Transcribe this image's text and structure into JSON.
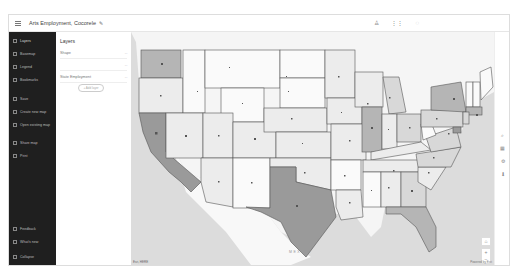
{
  "header": {
    "title": "Arts Employment, Cocorele",
    "icons": [
      "menu-icon",
      "pencil-icon",
      "notification-icon",
      "apps-icon",
      "user-icon"
    ]
  },
  "sidebar": {
    "items": [
      {
        "label": "Layers",
        "icon": "layers-icon",
        "active": true
      },
      {
        "label": "Basemap",
        "icon": "basemap-icon"
      },
      {
        "label": "Legend",
        "icon": "legend-icon"
      },
      {
        "label": "Bookmarks",
        "icon": "bookmark-icon"
      },
      {
        "label": "Save",
        "icon": "save-icon"
      },
      {
        "label": "Create new map",
        "icon": "new-map-icon"
      },
      {
        "label": "Open existing map",
        "icon": "open-map-icon"
      },
      {
        "label": "Share map",
        "icon": "share-icon"
      },
      {
        "label": "Print",
        "icon": "print-icon"
      }
    ],
    "bottom": [
      {
        "label": "Feedback",
        "icon": "feedback-icon"
      },
      {
        "label": "What's new",
        "icon": "whats-new-icon"
      },
      {
        "label": "Collapse",
        "icon": "collapse-icon"
      }
    ]
  },
  "panel": {
    "title": "Layers",
    "layers": [
      {
        "name": "Shape",
        "more": "···"
      },
      {
        "name": "",
        "more": "···"
      },
      {
        "name": "State Employment",
        "more": "···"
      }
    ],
    "add_layer_label": "+ Add layer"
  },
  "map": {
    "scale_label": "Esri, HERE",
    "attribution": "Powered by Esri",
    "country_label": "MEXICO",
    "colors": {
      "water": "#dcdcdc",
      "land": "#f5f5f5",
      "class1": "#fafafa",
      "class2": "#ececec",
      "class3": "#d8d8d8",
      "class4": "#b5b5b5",
      "class5": "#9a9a9a",
      "border": "#555555"
    }
  },
  "tools": {
    "items": [
      {
        "icon": "search-icon",
        "glyph": "⌕"
      },
      {
        "icon": "grid-icon",
        "glyph": "▦"
      },
      {
        "icon": "settings-icon",
        "glyph": "⚙"
      },
      {
        "icon": "pin-icon",
        "glyph": "⬇"
      }
    ],
    "zoom_in": "+",
    "zoom_out": "−",
    "home": "⌂"
  }
}
